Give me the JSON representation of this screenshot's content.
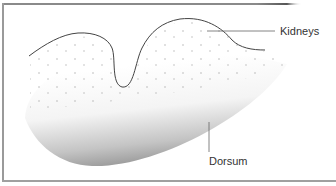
{
  "diagram": {
    "labels": {
      "kidneys": "Kidneys",
      "dorsum": "Dorsum"
    },
    "colors": {
      "border": "#9a9a9a",
      "outline": "#444444",
      "speckle": "#b0b0b0",
      "shade_dark": "#9c9c9c",
      "label_text": "#333333",
      "leader_line": "#666666"
    }
  }
}
